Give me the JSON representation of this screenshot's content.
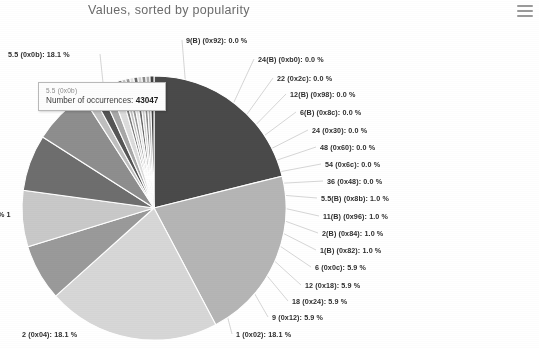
{
  "header": {
    "title": "Values, sorted by popularity",
    "menu_icon": "hamburger-menu-icon"
  },
  "tooltip": {
    "visible": true,
    "series_name": "5.5 (0x0b)",
    "metric_label": "Number of occurrences:",
    "metric_value": "43047"
  },
  "chart_data": {
    "type": "pie",
    "title": "Values, sorted by popularity",
    "xlabel": "",
    "ylabel": "",
    "legend_position": "callout-labels",
    "grid": false,
    "value_unit": "percent",
    "categories": [
      "5.5 (0x0b)",
      "2 (0x04)",
      "1 (0x02)",
      "9 (0x12)",
      "18 (0x24)",
      "12 (0x18)",
      "6 (0x0c)",
      "1(B) (0x82)",
      "2(B) (0x84)",
      "11(B) (0x96)",
      "5.5(B) (0x8b)",
      "36 (0x48)",
      "54 (0x6c)",
      "48 (0x60)",
      "24 (0x30)",
      "6(B) (0x8c)",
      "12(B) (0x98)",
      "22 (0x2c)",
      "24(B) (0xb0)",
      "9(B) (0x92)"
    ],
    "values": [
      18.1,
      18.1,
      18.1,
      5.9,
      5.9,
      5.9,
      5.9,
      1.0,
      1.0,
      1.0,
      1.0,
      0.0,
      0.0,
      0.0,
      0.0,
      0.0,
      0.0,
      0.0,
      0.0,
      0.0
    ],
    "labels": [
      "5.5 (0x0b): 18.1 %",
      "2 (0x04): 18.1 %",
      "1 (0x02): 18.1 %",
      "9 (0x12): 5.9 %",
      "18 (0x24): 5.9 %",
      "12 (0x18): 5.9 %",
      "6 (0x0c): 5.9 %",
      "1(B) (0x82): 1.0 %",
      "2(B) (0x84): 1.0 %",
      "11(B) (0x96): 1.0 %",
      "5.5(B) (0x8b): 1.0 %",
      "36 (0x48): 0.0 %",
      "54 (0x6c): 0.0 %",
      "48 (0x60): 0.0 %",
      "24 (0x30): 0.0 %",
      "6(B) (0x8c): 0.0 %",
      "12(B) (0x98): 0.0 %",
      "22 (0x2c): 0.0 %",
      "24(B) (0xb0): 0.0 %",
      "9(B) (0x92): 0.0 %"
    ],
    "slice_colors": [
      "#4a4a4a",
      "#b5b5b5",
      "#d7d7d7",
      "#9a9a9a",
      "#c9c9c9",
      "#6e6e6e",
      "#8e8e8e",
      "#bfbfbf",
      "#555555",
      "#a8a8a8",
      "#dcdcdc",
      "#7c7c7c",
      "#c2c2c2",
      "#989898",
      "#e2e2e2",
      "#6a6a6a",
      "#cfcfcf",
      "#8a8a8a",
      "#b0b0b0",
      "#3f3f3f"
    ],
    "hovered_slice": "5.5 (0x0b)",
    "hovered_occurrences": 43047
  },
  "callouts": {
    "left": [
      {
        "text": "5.5 (0x0b): 18.1 %",
        "x": 8,
        "y": 50
      },
      {
        "text": "% 1",
        "x": -2,
        "y": 210
      },
      {
        "text": "2 (0x04): 18.1 %",
        "x": 22,
        "y": 330
      }
    ],
    "right": [
      {
        "text": "9(B) (0x92): 0.0 %",
        "x": 186,
        "y": 36
      },
      {
        "text": "24(B) (0xb0): 0.0 %",
        "x": 258,
        "y": 55
      },
      {
        "text": "22 (0x2c): 0.0 %",
        "x": 277,
        "y": 74
      },
      {
        "text": "12(B) (0x98): 0.0 %",
        "x": 290,
        "y": 90
      },
      {
        "text": "6(B) (0x8c): 0.0 %",
        "x": 300,
        "y": 108
      },
      {
        "text": "24 (0x30): 0.0 %",
        "x": 312,
        "y": 126
      },
      {
        "text": "48 (0x60): 0.0 %",
        "x": 320,
        "y": 143
      },
      {
        "text": "54 (0x6c): 0.0 %",
        "x": 325,
        "y": 160
      },
      {
        "text": "36 (0x48): 0.0 %",
        "x": 327,
        "y": 177
      },
      {
        "text": "5.5(B) (0x8b): 1.0 %",
        "x": 321,
        "y": 194
      },
      {
        "text": "11(B) (0x96): 1.0 %",
        "x": 323,
        "y": 212
      },
      {
        "text": "2(B) (0x84): 1.0 %",
        "x": 322,
        "y": 229
      },
      {
        "text": "1(B) (0x82): 1.0 %",
        "x": 320,
        "y": 246
      },
      {
        "text": "6 (0x0c): 5.9 %",
        "x": 315,
        "y": 263
      },
      {
        "text": "12 (0x18): 5.9 %",
        "x": 305,
        "y": 281
      },
      {
        "text": "18 (0x24): 5.9 %",
        "x": 292,
        "y": 297
      },
      {
        "text": "9 (0x12): 5.9 %",
        "x": 272,
        "y": 313
      },
      {
        "text": "1 (0x02): 18.1 %",
        "x": 236,
        "y": 330
      }
    ]
  }
}
